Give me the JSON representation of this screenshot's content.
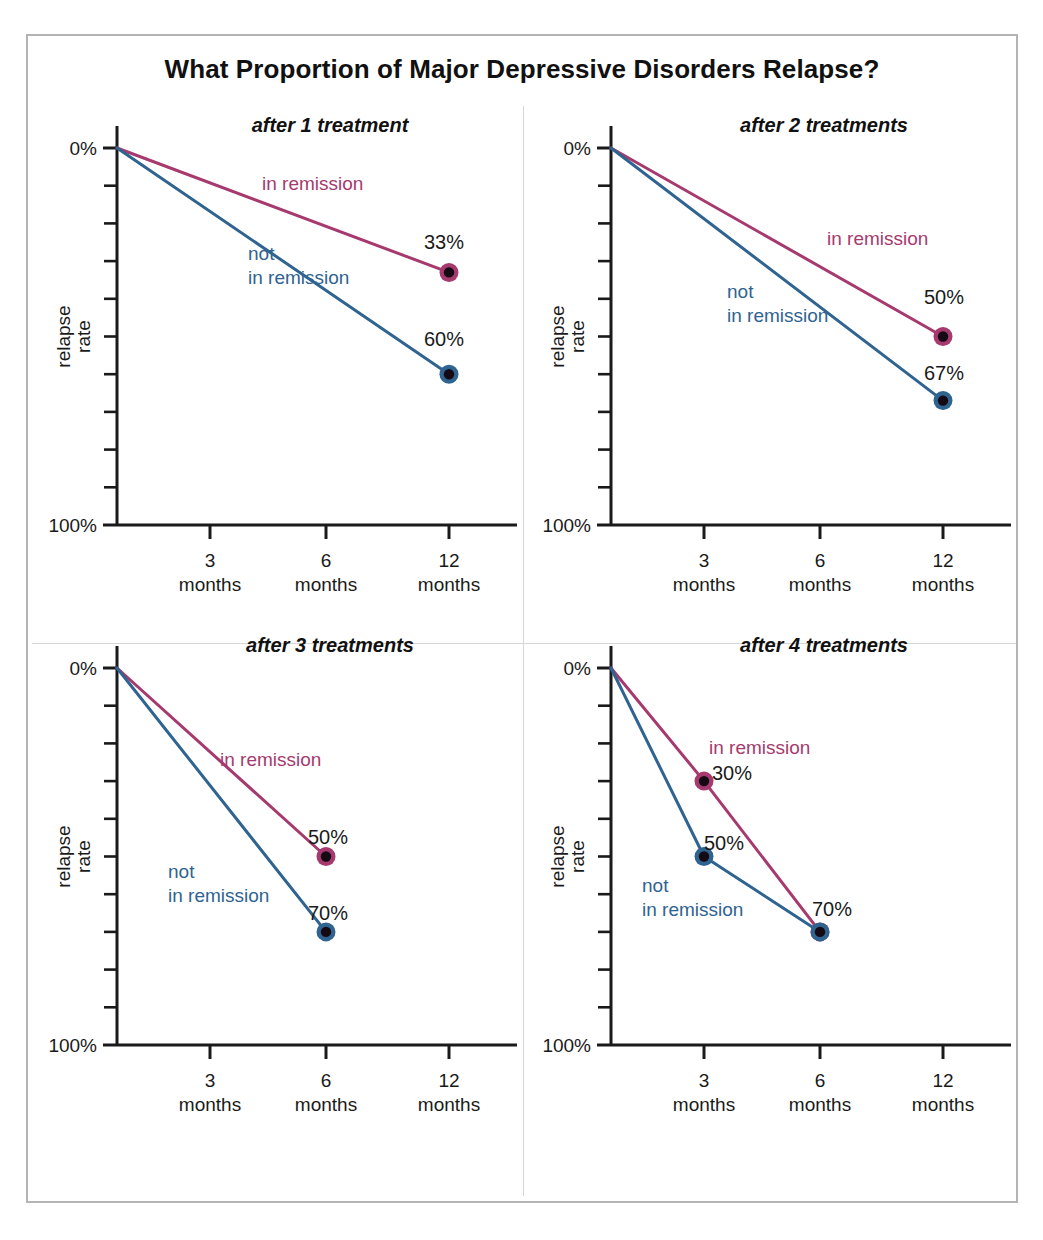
{
  "figure": {
    "title": "What Proportion of Major Depressive Disorders Relapse?",
    "border_color": "#b4b4b6",
    "divider_color": "#d6d6d8",
    "background": "#ffffff"
  },
  "colors": {
    "in_remission": "#a63a6e",
    "not_in_remission": "#2f6390",
    "marker_core": "#150a14",
    "axis": "#1a1a1a",
    "text": "#1a1a1a"
  },
  "axes": {
    "ylabel_line1": "relapse",
    "ylabel_line2": "rate",
    "y_top_label": "0%",
    "y_bottom_label": "100%",
    "ylim": [
      0,
      100
    ],
    "y_tick_interval": 10,
    "x_categories": [
      "3",
      "6",
      "12"
    ],
    "x_unit": "months",
    "grid": false,
    "legend": "inline-annotations"
  },
  "chart_data": [
    {
      "type": "line",
      "title": "after 1 treatment",
      "xlabel": "",
      "ylabel": "relapse rate",
      "ylim": [
        0,
        100
      ],
      "y_inverted": true,
      "x": [
        "0",
        "3",
        "6",
        "12"
      ],
      "categories": [
        "3 months",
        "6 months",
        "12 months"
      ],
      "series": [
        {
          "name": "in remission",
          "color": "#a63a6e",
          "points": [
            {
              "x": "0",
              "y": 0,
              "marker": false,
              "label": null
            },
            {
              "x": "12",
              "y": 33,
              "marker": true,
              "label": "33%"
            }
          ],
          "label_pos": {
            "x": "between 3 and 6",
            "align": "left"
          }
        },
        {
          "name": "not in remission",
          "color": "#2f6390",
          "points": [
            {
              "x": "0",
              "y": 0,
              "marker": false,
              "label": null
            },
            {
              "x": "12",
              "y": 60,
              "marker": true,
              "label": "60%"
            }
          ],
          "label_pos": {
            "x": "around 6",
            "align": "left"
          }
        }
      ]
    },
    {
      "type": "line",
      "title": "after 2 treatments",
      "xlabel": "",
      "ylabel": "relapse rate",
      "ylim": [
        0,
        100
      ],
      "y_inverted": true,
      "x": [
        "0",
        "3",
        "6",
        "12"
      ],
      "categories": [
        "3 months",
        "6 months",
        "12 months"
      ],
      "series": [
        {
          "name": "in remission",
          "color": "#a63a6e",
          "points": [
            {
              "x": "0",
              "y": 0,
              "marker": false,
              "label": null
            },
            {
              "x": "12",
              "y": 50,
              "marker": true,
              "label": "50%"
            }
          ]
        },
        {
          "name": "not in remission",
          "color": "#2f6390",
          "points": [
            {
              "x": "0",
              "y": 0,
              "marker": false,
              "label": null
            },
            {
              "x": "12",
              "y": 67,
              "marker": true,
              "label": "67%"
            }
          ]
        }
      ]
    },
    {
      "type": "line",
      "title": "after 3 treatments",
      "xlabel": "",
      "ylabel": "relapse rate",
      "ylim": [
        0,
        100
      ],
      "y_inverted": true,
      "x": [
        "0",
        "3",
        "6",
        "12"
      ],
      "categories": [
        "3 months",
        "6 months",
        "12 months"
      ],
      "series": [
        {
          "name": "in remission",
          "color": "#a63a6e",
          "points": [
            {
              "x": "0",
              "y": 0,
              "marker": false,
              "label": null
            },
            {
              "x": "6",
              "y": 50,
              "marker": true,
              "label": "50%"
            }
          ]
        },
        {
          "name": "not in remission",
          "color": "#2f6390",
          "points": [
            {
              "x": "0",
              "y": 0,
              "marker": false,
              "label": null
            },
            {
              "x": "6",
              "y": 70,
              "marker": true,
              "label": "70%"
            }
          ]
        }
      ]
    },
    {
      "type": "line",
      "title": "after 4 treatments",
      "xlabel": "",
      "ylabel": "relapse rate",
      "ylim": [
        0,
        100
      ],
      "y_inverted": true,
      "x": [
        "0",
        "3",
        "6",
        "12"
      ],
      "categories": [
        "3 months",
        "6 months",
        "12 months"
      ],
      "series": [
        {
          "name": "in remission",
          "color": "#a63a6e",
          "points": [
            {
              "x": "0",
              "y": 0,
              "marker": false,
              "label": null
            },
            {
              "x": "3",
              "y": 30,
              "marker": true,
              "label": "30%"
            },
            {
              "x": "6",
              "y": 70,
              "marker": true,
              "label": "70%"
            }
          ]
        },
        {
          "name": "not in remission",
          "color": "#2f6390",
          "points": [
            {
              "x": "0",
              "y": 0,
              "marker": false,
              "label": null
            },
            {
              "x": "3",
              "y": 50,
              "marker": true,
              "label": "50%"
            },
            {
              "x": "6",
              "y": 70,
              "marker": true,
              "label": null
            }
          ]
        }
      ]
    }
  ],
  "panels": [
    {
      "id": "panel-1",
      "title": "after 1 treatment",
      "series_labels": [
        {
          "text": "in remission",
          "color": "#a63a6e",
          "x": 232,
          "y": 82,
          "lines": [
            "in remission"
          ]
        },
        {
          "text": "not in remission",
          "color": "#2f6390",
          "x": 218,
          "y": 152,
          "lines": [
            "not",
            "in remission"
          ]
        }
      ],
      "value_labels": [
        {
          "text": "33%",
          "x": 394,
          "y": 141
        },
        {
          "text": "60%",
          "x": 394,
          "y": 238
        }
      ]
    },
    {
      "id": "panel-2",
      "title": "after 2 treatments",
      "series_labels": [
        {
          "text": "in remission",
          "color": "#a63a6e",
          "x": 303,
          "y": 137,
          "lines": [
            "in remission"
          ]
        },
        {
          "text": "not in remission",
          "color": "#2f6390",
          "x": 203,
          "y": 190,
          "lines": [
            "not",
            "in remission"
          ]
        }
      ],
      "value_labels": [
        {
          "text": "50%",
          "x": 400,
          "y": 196
        },
        {
          "text": "67%",
          "x": 400,
          "y": 272
        }
      ]
    },
    {
      "id": "panel-3",
      "title": "after 3 treatments",
      "series_labels": [
        {
          "text": "in remission",
          "color": "#a63a6e",
          "x": 190,
          "y": 138,
          "lines": [
            "in remission"
          ]
        },
        {
          "text": "not in remission",
          "color": "#2f6390",
          "x": 138,
          "y": 250,
          "lines": [
            "not",
            "in remission"
          ]
        }
      ],
      "value_labels": [
        {
          "text": "50%",
          "x": 278,
          "y": 216
        },
        {
          "text": "70%",
          "x": 278,
          "y": 292
        }
      ]
    },
    {
      "id": "panel-4",
      "title": "after 4 treatments",
      "series_labels": [
        {
          "text": "in remission",
          "color": "#a63a6e",
          "x": 185,
          "y": 126,
          "lines": [
            "in remission"
          ]
        },
        {
          "text": "not in remission",
          "color": "#2f6390",
          "x": 118,
          "y": 264,
          "lines": [
            "not",
            "in remission"
          ]
        }
      ],
      "value_labels": [
        {
          "text": "30%",
          "x": 188,
          "y": 152
        },
        {
          "text": "50%",
          "x": 180,
          "y": 222
        },
        {
          "text": "70%",
          "x": 288,
          "y": 288
        }
      ]
    }
  ]
}
